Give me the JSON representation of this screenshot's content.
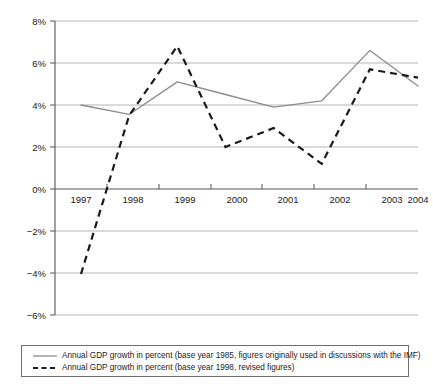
{
  "chart_data": {
    "type": "line",
    "title": "",
    "subtitle": "",
    "xlabel": "",
    "ylabel": "",
    "categories": [
      "1997",
      "1998",
      "1999",
      "2000",
      "2001",
      "2002",
      "2003",
      "2004"
    ],
    "x": [
      1997,
      1998,
      1999,
      2000,
      2001,
      2002,
      2003,
      2004
    ],
    "ylim": [
      -6,
      8
    ],
    "xlim": [
      1997,
      2004
    ],
    "y_ticks": [
      8,
      6,
      4,
      2,
      0,
      -2,
      -4,
      -6
    ],
    "y_tick_labels": [
      "8%",
      "6%",
      "4%",
      "2%",
      "0%",
      "−2%",
      "−4%",
      "−6%"
    ],
    "grid": "horizontal",
    "legend_position": "bottom",
    "series": [
      {
        "name": "Annual GDP growth in percent (base year 1985, figures originally used in discussions with the IMF)",
        "style": "solid",
        "color": "#8c8c8c",
        "values": [
          4.0,
          3.55,
          5.1,
          4.5,
          3.9,
          4.2,
          6.6,
          4.9
        ]
      },
      {
        "name": "Annual GDP growth in percent (base year 1998, revised figures)",
        "style": "dashed",
        "color": "#1a1a1a",
        "values": [
          -4.05,
          3.5,
          6.8,
          2.0,
          2.9,
          1.2,
          5.7,
          5.3
        ]
      }
    ]
  },
  "axes": {
    "y_tick_labels": [
      "8%",
      "6%",
      "4%",
      "2%",
      "0%",
      "−2%",
      "−4%",
      "−6%"
    ],
    "x_tick_labels": [
      "1997",
      "1998",
      "1999",
      "2000",
      "2001",
      "2002",
      "2003",
      "2004"
    ]
  },
  "legend": {
    "items": [
      {
        "label": "Annual GDP growth in percent (base year 1985, figures originally used in discussions with the IMF)",
        "style": "solid",
        "color": "#8c8c8c"
      },
      {
        "label": "Annual GDP growth in percent (base year 1998, revised figures)",
        "style": "dashed",
        "color": "#1a1a1a"
      }
    ]
  },
  "colors": {
    "series_solid": "#8c8c8c",
    "series_dashed": "#1a1a1a",
    "gridline": "#b5b5b5",
    "axis": "#555555",
    "background": "#ffffff"
  }
}
